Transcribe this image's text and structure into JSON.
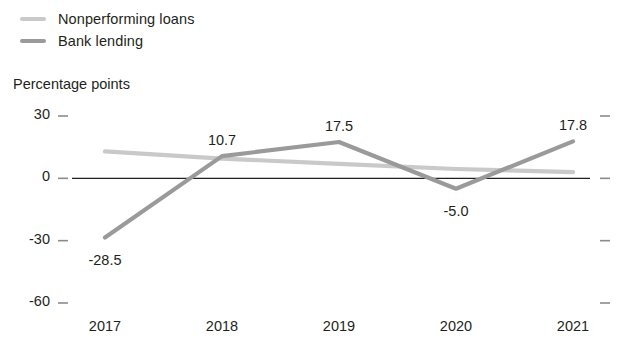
{
  "legend": {
    "position": "top-left",
    "items": [
      {
        "label": "Nonperforming loans",
        "color": "#c9c9c9",
        "icon": "line-swatch-icon"
      },
      {
        "label": "Bank lending",
        "color": "#9a9a9a",
        "icon": "line-swatch-icon"
      }
    ]
  },
  "axis_unit": "Percentage points",
  "colors": {
    "nonperforming_loans": "#c9c9c9",
    "bank_lending": "#9a9a9a",
    "zero_line": "#231f20",
    "tick": "#8c8c8c",
    "text": "#231f20",
    "background": "#ffffff"
  },
  "y_ticks": [
    "30",
    "0",
    "-30",
    "-60"
  ],
  "x_ticks": [
    "2017",
    "2018",
    "2019",
    "2020",
    "2021"
  ],
  "point_labels": {
    "bank_lending_2017": "-28.5",
    "bank_lending_2018": "10.7",
    "bank_lending_2019": "17.5",
    "bank_lending_2020": "-5.0",
    "bank_lending_2021": "17.8"
  },
  "chart_data": {
    "type": "line",
    "title": "",
    "subtitle": "",
    "xlabel": "",
    "ylabel": "Percentage points",
    "categories": [
      "2017",
      "2018",
      "2019",
      "2020",
      "2021"
    ],
    "ylim": [
      -60,
      30
    ],
    "y_tick_values": [
      30,
      0,
      -30,
      -60
    ],
    "grid": false,
    "zero_line": true,
    "legend_position": "top-left",
    "series": [
      {
        "name": "Nonperforming loans",
        "color": "#c9c9c9",
        "values": [
          13.0,
          9.5,
          7.0,
          4.5,
          3.0
        ],
        "labels": [
          "",
          "",
          "",
          "",
          ""
        ]
      },
      {
        "name": "Bank lending",
        "color": "#9a9a9a",
        "values": [
          -28.5,
          10.7,
          17.5,
          -5.0,
          17.8
        ],
        "labels": [
          "-28.5",
          "10.7",
          "17.5",
          "-5.0",
          "17.8"
        ]
      }
    ]
  }
}
